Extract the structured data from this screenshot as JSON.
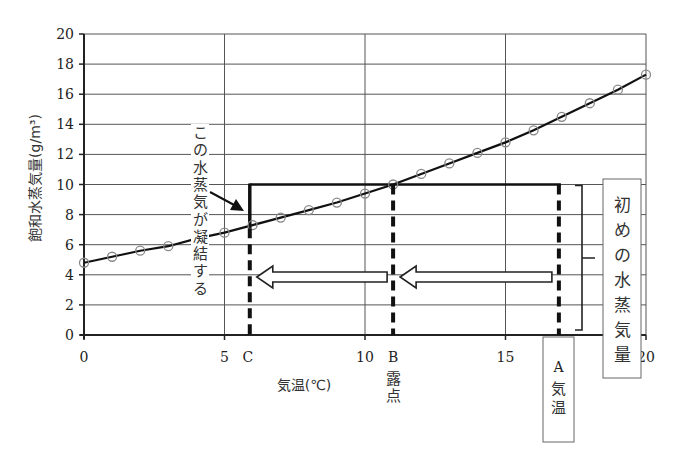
{
  "chart_data": {
    "type": "line",
    "title": "",
    "xlabel": "気温(℃)",
    "ylabel": "飽和水蒸気量(g/m³)",
    "xlim": [
      0,
      20
    ],
    "ylim": [
      0,
      20
    ],
    "x_ticks": [
      0,
      5,
      10,
      15,
      20
    ],
    "y_ticks": [
      0,
      2,
      4,
      6,
      8,
      10,
      12,
      14,
      16,
      18,
      20
    ],
    "grid": true,
    "series": [
      {
        "name": "飽和水蒸気量",
        "marker": "open-circle",
        "x": [
          0,
          1,
          2,
          3,
          4,
          5,
          6,
          7,
          8,
          9,
          10,
          11,
          12,
          13,
          14,
          15,
          16,
          17,
          18,
          19,
          20
        ],
        "values": [
          4.8,
          5.2,
          5.6,
          5.9,
          6.4,
          6.8,
          7.3,
          7.8,
          8.3,
          8.8,
          9.4,
          10.0,
          10.7,
          11.4,
          12.1,
          12.8,
          13.6,
          14.5,
          15.4,
          16.3,
          17.3
        ]
      }
    ],
    "reference_lines": [
      {
        "label": "C",
        "x": 5.9,
        "style": "dashed",
        "y_top": 10
      },
      {
        "label": "B",
        "x": 11.0,
        "style": "dashed",
        "y_top": 10,
        "caption": "露点"
      },
      {
        "label": "A",
        "x": 16.9,
        "style": "dashed",
        "y_top": 10,
        "caption": "気温"
      }
    ],
    "initial_vapor_level": 10,
    "annotations": [
      {
        "text": "この水蒸気が凝結する",
        "orientation": "vertical",
        "points_to": "C at curve"
      },
      {
        "text": "初めの水蒸気量",
        "orientation": "vertical",
        "boxed": true,
        "bracket": "0 to 10 at A"
      },
      {
        "text": "A 気温",
        "boxed": true
      },
      {
        "text": "B 露点"
      },
      {
        "text": "C"
      }
    ],
    "arrows": [
      {
        "from_x": 16.9,
        "to_x": 11.0,
        "y": 3.9,
        "style": "hollow"
      },
      {
        "from_x": 11.0,
        "to_x": 5.9,
        "y": 3.9,
        "style": "hollow"
      }
    ]
  },
  "labels": {
    "x_axis_title": "気温(℃)",
    "y_axis_title": "飽和水蒸気量(g/m³)",
    "x_tick_0": "0",
    "x_tick_5": "5",
    "x_tick_10": "10",
    "x_tick_15": "15",
    "x_tick_20": "20",
    "y_ticks": [
      "0",
      "2",
      "4",
      "6",
      "8",
      "10",
      "12",
      "14",
      "16",
      "18",
      "20"
    ],
    "point_c": "C",
    "point_b": "B",
    "point_b_caption": [
      "露",
      "点"
    ],
    "point_a": "A",
    "point_a_caption": [
      "気",
      "温"
    ],
    "condense_note": [
      "こ",
      "の",
      "水",
      "蒸",
      "気",
      "が",
      "凝",
      "結",
      "す",
      "る"
    ],
    "initial_vapor_note": [
      "初",
      "め",
      "の",
      "水",
      "蒸",
      "気",
      "量"
    ]
  }
}
